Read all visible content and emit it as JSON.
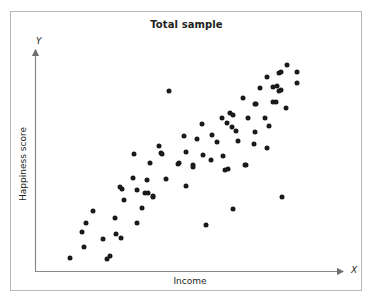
{
  "chart_data": {
    "type": "scatter",
    "title": "Total sample",
    "xlabel": "Income",
    "ylabel": "Happiness score",
    "x_axis_letter": "X",
    "y_axis_letter": "Y",
    "grid": false,
    "legend": null,
    "axes": {
      "x_arrow": true,
      "y_arrow": true,
      "ticks": false,
      "tick_labels": false,
      "x_range_px": [
        35,
        345
      ],
      "y_range_px": [
        48,
        272
      ]
    },
    "marker": {
      "shape": "circle",
      "color": "#1a1a1a",
      "size_px": 5
    },
    "n_points": 77,
    "points": [
      [
        93,
        211
      ],
      [
        86,
        223
      ],
      [
        82,
        232
      ],
      [
        103,
        239
      ],
      [
        84,
        247
      ],
      [
        70,
        258
      ],
      [
        107,
        259
      ],
      [
        122,
        189
      ],
      [
        137,
        190
      ],
      [
        148,
        193
      ],
      [
        153,
        197
      ],
      [
        124,
        200
      ],
      [
        142,
        208
      ],
      [
        115,
        218
      ],
      [
        137,
        223
      ],
      [
        116,
        234
      ],
      [
        121,
        238
      ],
      [
        110,
        256
      ],
      [
        134,
        154
      ],
      [
        161,
        153
      ],
      [
        150,
        163
      ],
      [
        178,
        164
      ],
      [
        133,
        178
      ],
      [
        147,
        180
      ],
      [
        166,
        179
      ],
      [
        120,
        187
      ],
      [
        159,
        146
      ],
      [
        145,
        193
      ],
      [
        153,
        196
      ],
      [
        230,
        113
      ],
      [
        202,
        124
      ],
      [
        227,
        123
      ],
      [
        236,
        131
      ],
      [
        184,
        136
      ],
      [
        212,
        135
      ],
      [
        197,
        139
      ],
      [
        217,
        142
      ],
      [
        186,
        152
      ],
      [
        162,
        154
      ],
      [
        203,
        155
      ],
      [
        223,
        156
      ],
      [
        179,
        163
      ],
      [
        193,
        165
      ],
      [
        211,
        160
      ],
      [
        228,
        169
      ],
      [
        186,
        186
      ],
      [
        287,
        65
      ],
      [
        297,
        72
      ],
      [
        279,
        73
      ],
      [
        297,
        83
      ],
      [
        277,
        86
      ],
      [
        279,
        91
      ],
      [
        276,
        102
      ],
      [
        286,
        108
      ],
      [
        267,
        77
      ],
      [
        281,
        72
      ],
      [
        260,
        88
      ],
      [
        273,
        87
      ],
      [
        281,
        90
      ],
      [
        243,
        98
      ],
      [
        255,
        104
      ],
      [
        273,
        102
      ],
      [
        233,
        115
      ],
      [
        248,
        118
      ],
      [
        222,
        118
      ],
      [
        265,
        118
      ],
      [
        232,
        127
      ],
      [
        269,
        126
      ],
      [
        255,
        132
      ],
      [
        256,
        104
      ],
      [
        238,
        141
      ],
      [
        254,
        144
      ],
      [
        267,
        148
      ],
      [
        246,
        165
      ],
      [
        169,
        91
      ],
      [
        282,
        197
      ],
      [
        233,
        209
      ],
      [
        206,
        225
      ],
      [
        193,
        167
      ],
      [
        225,
        170
      ],
      [
        245,
        165
      ]
    ]
  },
  "colors": {
    "frame": "#b8b8b8",
    "axis": "#7a7a7a",
    "text": "#231f20",
    "marker": "#1a1a1a",
    "background": "#ffffff"
  }
}
